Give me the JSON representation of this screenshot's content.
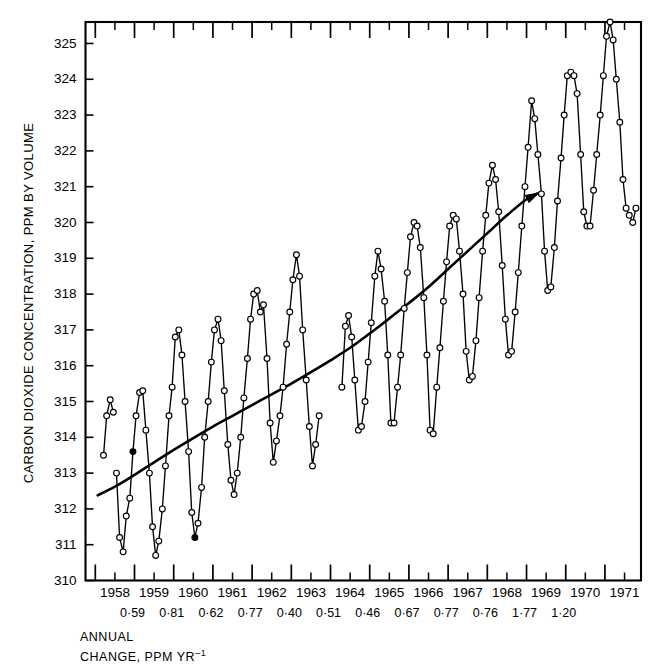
{
  "figure": {
    "background": "#ffffff",
    "ink": "#000000"
  },
  "axis_titles": {
    "y": "CARBON DIOXIDE CONCENTRATION, PPM BY VOLUME"
  },
  "caption": {
    "line1": "ANNUAL",
    "line2": "CHANGE, PPM YR",
    "line2_superscript": "-1"
  },
  "annual_change": {
    "label": "ANNUAL CHANGE, PPM YR-1",
    "years": [
      1958,
      1959,
      1960,
      1961,
      1962,
      1963,
      1964,
      1965,
      1966,
      1967,
      1968
    ],
    "values_text": [
      "0·59",
      "0·81",
      "0·62",
      "0·77",
      "0·40",
      "0·51",
      "0·46",
      "0·67",
      "0·77",
      "0·76",
      "1·77",
      "1·20"
    ],
    "values": [
      0.59,
      0.81,
      0.62,
      0.77,
      0.4,
      0.51,
      0.46,
      0.67,
      0.77,
      0.76,
      1.77,
      1.2
    ]
  },
  "chart_data": {
    "type": "line",
    "title": "",
    "subtitle": "",
    "xlabel": "",
    "ylabel": "CARBON DIOXIDE CONCENTRATION, PPM BY VOLUME",
    "xlim": [
      1957.75,
      1971.92
    ],
    "ylim": [
      310,
      325.6
    ],
    "yticks": [
      310,
      311,
      312,
      313,
      314,
      315,
      316,
      317,
      318,
      319,
      320,
      321,
      322,
      323,
      324,
      325
    ],
    "ytick_labels": [
      "310",
      "311",
      "312",
      "313",
      "314",
      "315",
      "316",
      "317",
      "318",
      "319",
      "320",
      "321",
      "322",
      "323",
      "324",
      "325"
    ],
    "xticks": [
      1958,
      1959,
      1960,
      1961,
      1962,
      1963,
      1964,
      1965,
      1966,
      1967,
      1968,
      1969,
      1970,
      1971
    ],
    "xtick_labels": [
      "1958",
      "1959",
      "1960",
      "1961",
      "1962",
      "1963",
      "1964",
      "1965",
      "1966",
      "1967",
      "1968",
      "1969",
      "1970",
      "1971"
    ],
    "grid": false,
    "legend": "none",
    "marker": "open-circle",
    "series": [
      {
        "name": "Monthly mean CO2 concentration",
        "marker": "open-circle",
        "x": [
          1958.21,
          1958.29,
          1958.38,
          1958.46,
          1958.54,
          1958.62,
          1958.71,
          1958.79,
          1958.88,
          1958.96,
          1959.04,
          1959.13,
          1959.21,
          1959.29,
          1959.38,
          1959.46,
          1959.54,
          1959.62,
          1959.71,
          1959.79,
          1959.88,
          1959.96,
          1960.04,
          1960.13,
          1960.21,
          1960.29,
          1960.38,
          1960.46,
          1960.54,
          1960.62,
          1960.71,
          1960.79,
          1960.88,
          1960.96,
          1961.04,
          1961.13,
          1961.21,
          1961.29,
          1961.38,
          1961.46,
          1961.54,
          1961.62,
          1961.71,
          1961.79,
          1961.88,
          1961.96,
          1962.04,
          1962.13,
          1962.21,
          1962.29,
          1962.38,
          1962.46,
          1962.54,
          1962.62,
          1962.71,
          1962.79,
          1962.88,
          1962.96,
          1963.04,
          1963.13,
          1963.21,
          1963.29,
          1963.38,
          1963.46,
          1963.54,
          1963.62,
          1963.71,
          1964.29,
          1964.38,
          1964.46,
          1964.54,
          1964.62,
          1964.71,
          1964.79,
          1964.88,
          1964.96,
          1965.04,
          1965.13,
          1965.21,
          1965.29,
          1965.38,
          1965.46,
          1965.54,
          1965.62,
          1965.71,
          1965.79,
          1965.88,
          1965.96,
          1966.04,
          1966.13,
          1966.21,
          1966.29,
          1966.38,
          1966.46,
          1966.54,
          1966.62,
          1966.71,
          1966.79,
          1966.88,
          1966.96,
          1967.04,
          1967.13,
          1967.21,
          1967.29,
          1967.38,
          1967.46,
          1967.54,
          1967.62,
          1967.71,
          1967.79,
          1967.88,
          1967.96,
          1968.04,
          1968.13,
          1968.21,
          1968.29,
          1968.38,
          1968.46,
          1968.54,
          1968.62,
          1968.71,
          1968.79,
          1968.88,
          1968.96,
          1969.04,
          1969.13,
          1969.21,
          1969.29,
          1969.38,
          1969.46,
          1969.54,
          1969.62,
          1969.71,
          1969.79,
          1969.88,
          1969.96,
          1970.04,
          1970.13,
          1970.21,
          1970.29,
          1970.38,
          1970.46,
          1970.54,
          1970.62,
          1970.71,
          1970.79,
          1970.88,
          1970.96,
          1971.04,
          1971.13,
          1971.21,
          1971.29,
          1971.38,
          1971.46,
          1971.54,
          1971.62,
          1971.71,
          1971.79
        ],
        "y": [
          313.5,
          314.6,
          315.05,
          314.7,
          313.0,
          311.2,
          310.8,
          311.8,
          312.3,
          313.6,
          314.6,
          315.25,
          315.3,
          314.2,
          313.0,
          311.5,
          310.7,
          311.1,
          312.0,
          313.2,
          314.6,
          315.4,
          316.8,
          317.0,
          316.3,
          315.0,
          313.6,
          311.9,
          311.2,
          311.6,
          312.6,
          314.0,
          315.0,
          316.1,
          317.0,
          317.3,
          316.7,
          315.3,
          313.8,
          312.8,
          312.4,
          313.0,
          314.0,
          315.1,
          316.2,
          317.3,
          318.0,
          318.1,
          317.5,
          317.7,
          316.2,
          314.4,
          313.3,
          313.9,
          314.6,
          315.4,
          316.6,
          317.5,
          318.4,
          319.1,
          318.5,
          317.0,
          315.6,
          314.3,
          313.2,
          313.8,
          314.6,
          315.4,
          317.1,
          317.4,
          316.8,
          315.6,
          314.2,
          314.3,
          315.0,
          316.1,
          317.2,
          318.5,
          319.2,
          318.7,
          317.8,
          316.3,
          314.4,
          314.4,
          315.4,
          316.3,
          317.6,
          318.6,
          319.6,
          320.0,
          319.9,
          319.3,
          317.9,
          316.3,
          314.2,
          314.1,
          315.4,
          316.5,
          317.8,
          318.9,
          319.9,
          320.2,
          320.1,
          319.2,
          318.0,
          316.4,
          315.6,
          315.7,
          316.7,
          317.9,
          319.2,
          320.2,
          321.1,
          321.6,
          321.2,
          320.3,
          318.8,
          317.3,
          316.3,
          316.4,
          317.5,
          318.6,
          319.9,
          321.0,
          322.1,
          323.4,
          322.9,
          321.9,
          320.8,
          319.2,
          318.1,
          318.2,
          319.3,
          320.6,
          321.8,
          323.0,
          324.1,
          324.2,
          324.1,
          323.6,
          321.9,
          320.3,
          319.9,
          319.9,
          320.9,
          321.9,
          323.0,
          324.1,
          325.2,
          325.6,
          325.1,
          324.0,
          322.8,
          321.2,
          320.4,
          320.2,
          320.0,
          320.4
        ],
        "gaps_after_index": [
          3,
          66
        ]
      },
      {
        "name": "Smoothed secular trend",
        "marker": "none",
        "arrow_end": true,
        "x": [
          1958.06,
          1958.5,
          1959.0,
          1959.5,
          1960.0,
          1960.5,
          1961.0,
          1961.5,
          1962.0,
          1962.5,
          1963.0,
          1963.5,
          1964.0,
          1964.5,
          1965.0,
          1965.5,
          1966.0,
          1966.5,
          1967.0,
          1967.5,
          1968.0,
          1968.5,
          1969.0,
          1969.3
        ],
        "y": [
          312.38,
          312.62,
          312.95,
          313.3,
          313.65,
          313.98,
          314.3,
          314.6,
          314.9,
          315.2,
          315.5,
          315.82,
          316.15,
          316.5,
          316.9,
          317.32,
          317.75,
          318.2,
          318.7,
          319.2,
          319.7,
          320.2,
          320.65,
          320.82
        ]
      }
    ]
  }
}
